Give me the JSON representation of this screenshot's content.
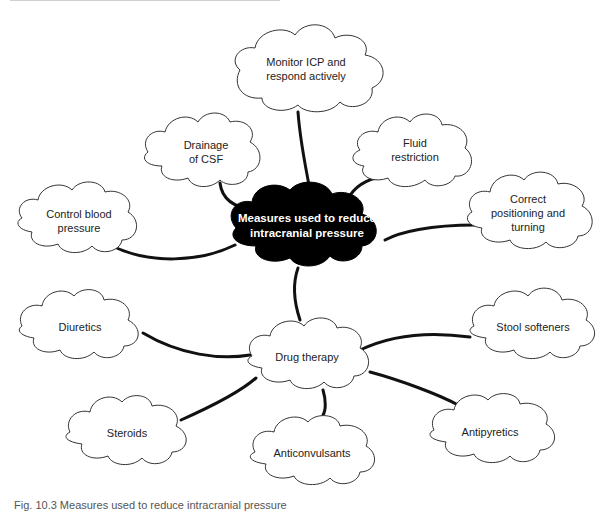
{
  "diagram": {
    "type": "mind-map",
    "center": {
      "id": "center",
      "label_line1": "Measures used to reduce",
      "label_line2": "intracranial pressure",
      "x": 307,
      "y": 225
    },
    "nodes": [
      {
        "id": "monitor-icp",
        "label_line1": "Monitor ICP and",
        "label_line2": "respond actively",
        "x": 306,
        "y": 69,
        "parent": "center"
      },
      {
        "id": "drainage-csf",
        "label_line1": "Drainage",
        "label_line2": "of CSF",
        "x": 206,
        "y": 153,
        "parent": "center"
      },
      {
        "id": "fluid-restriction",
        "label_line1": "Fluid",
        "label_line2": "restriction",
        "x": 417,
        "y": 150,
        "parent": "center"
      },
      {
        "id": "control-bp",
        "label_line1": "Control blood",
        "label_line2": "pressure",
        "x": 81,
        "y": 221,
        "parent": "center"
      },
      {
        "id": "correct-positioning",
        "label_line1": "Correct",
        "label_line2": "positioning and",
        "label_line3": "turning",
        "x": 528,
        "y": 214,
        "parent": "center"
      },
      {
        "id": "drug-therapy",
        "label_line1": "Drug therapy",
        "x": 307,
        "y": 357,
        "parent": "center"
      },
      {
        "id": "diuretics",
        "label_line1": "Diuretics",
        "x": 80,
        "y": 327,
        "parent": "drug-therapy"
      },
      {
        "id": "stool-softeners",
        "label_line1": "Stool softeners",
        "x": 533,
        "y": 327,
        "parent": "drug-therapy"
      },
      {
        "id": "steroids",
        "label_line1": "Steroids",
        "x": 127,
        "y": 433,
        "parent": "drug-therapy"
      },
      {
        "id": "anticonvulsants",
        "label_line1": "Anticonvulsants",
        "x": 314,
        "y": 453,
        "parent": "drug-therapy"
      },
      {
        "id": "antipyretics",
        "label_line1": "Antipyretics",
        "x": 492,
        "y": 432,
        "parent": "drug-therapy"
      }
    ]
  },
  "caption": "Fig. 10.3   Measures used to reduce intracranial pressure",
  "colors": {
    "center_fill": "#000000",
    "node_fill": "#ffffff",
    "outline": "#333333",
    "connector": "#111111",
    "center_text": "#ffffff",
    "node_text": "#222222"
  }
}
